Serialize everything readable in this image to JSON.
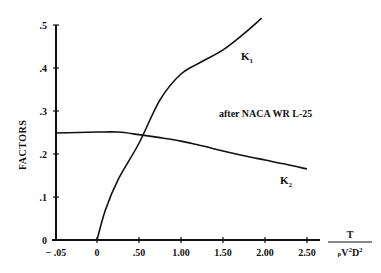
{
  "chart_data": {
    "type": "line",
    "title": "",
    "annotation": "after NACA WR L-25",
    "xlabel": "T / (ρV²D²)",
    "xlabel_numerator": "T",
    "xlabel_denominator": "ρV²D²",
    "ylabel": "FACTORS",
    "x_ticks": [
      "-.05",
      "0",
      ".50",
      "1.00",
      "1.50",
      "2.00",
      "2.50"
    ],
    "x_tick_values": [
      -0.05,
      0,
      0.5,
      1.0,
      1.5,
      2.0,
      2.5
    ],
    "y_ticks": [
      "0",
      ".1",
      ".2",
      ".3",
      ".4",
      ".5"
    ],
    "y_tick_values": [
      0,
      0.1,
      0.2,
      0.3,
      0.4,
      0.5
    ],
    "xlim": [
      -0.05,
      2.5
    ],
    "ylim": [
      0,
      0.5
    ],
    "grid": false,
    "legend": "inline labels",
    "series": [
      {
        "name": "K1",
        "label_main": "K",
        "label_sub": "1",
        "x": [
          0,
          0.1,
          0.25,
          0.5,
          0.75,
          1.0,
          1.25,
          1.5,
          1.75,
          1.96
        ],
        "values": [
          0,
          0.07,
          0.14,
          0.225,
          0.326,
          0.386,
          0.415,
          0.442,
          0.48,
          0.516
        ]
      },
      {
        "name": "K2",
        "label_main": "K",
        "label_sub": "2",
        "x": [
          -0.05,
          0,
          0.25,
          0.5,
          0.75,
          1.0,
          1.25,
          1.5,
          1.75,
          2.0,
          2.25,
          2.5
        ],
        "values": [
          0.249,
          0.251,
          0.251,
          0.245,
          0.238,
          0.23,
          0.219,
          0.207,
          0.196,
          0.186,
          0.176,
          0.165
        ]
      }
    ]
  },
  "colors": {
    "axis": "#111111",
    "line": "#111111",
    "background": "#ffffff"
  }
}
